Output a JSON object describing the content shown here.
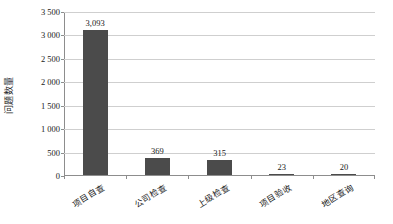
{
  "chart_data": {
    "type": "bar",
    "title": "",
    "subtitle": "",
    "xlabel": "",
    "ylabel": "问题数量",
    "categories": [
      "项目自查",
      "公司检查",
      "上级检查",
      "项目验收",
      "地区查询"
    ],
    "values": [
      3093,
      369,
      315,
      23,
      20
    ],
    "value_labels": [
      "3,093",
      "369",
      "315",
      "23",
      "20"
    ],
    "ylim": [
      0,
      3500
    ],
    "ytick_values": [
      0,
      500,
      1000,
      1500,
      2000,
      2500,
      3000,
      3500
    ],
    "ytick_labels": [
      "0",
      "500",
      "1 000",
      "1 500",
      "2 000",
      "2 500",
      "3 000",
      "3 500"
    ],
    "grid": true,
    "legend": false,
    "legend_position": "none",
    "series": [
      {
        "name": "问题数量",
        "values": [
          3093,
          369,
          315,
          23,
          20
        ],
        "color": "#4b4b4b"
      }
    ],
    "colors": {
      "bar": "#4b4b4b",
      "gridline": "#cfcfcf",
      "axis": "#8d8d8d",
      "text": "#1a1a1a",
      "background": "#ffffff"
    }
  }
}
